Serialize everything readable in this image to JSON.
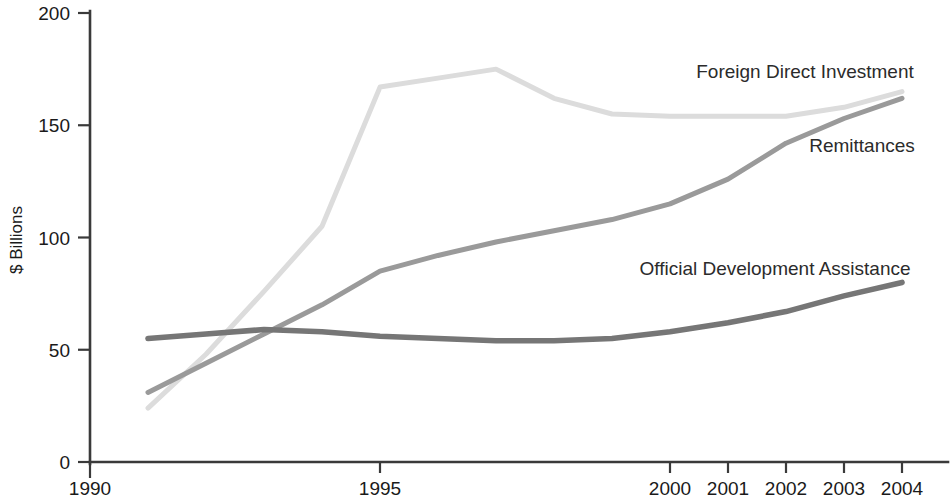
{
  "chart_data": {
    "type": "line",
    "title": "",
    "subtitle": "",
    "xlabel": "",
    "ylabel": "$ Billions",
    "ylim": [
      0,
      200
    ],
    "xlim": [
      1990,
      2004.3
    ],
    "grid": false,
    "legend_position": "inline-right-of-series",
    "y_ticks": [
      0,
      50,
      100,
      150,
      200
    ],
    "y_tick_labels": [
      "0",
      "50",
      "100",
      "150",
      "200"
    ],
    "x_ticks": [
      1990,
      1995,
      2000,
      2001,
      2002,
      2003,
      2004
    ],
    "x_tick_labels": [
      "1990",
      "1995",
      "2000",
      "2001",
      "2002",
      "2003",
      "2004"
    ],
    "x": [
      1991,
      1992,
      1993,
      1994,
      1995,
      1996,
      1997,
      1998,
      1999,
      2000,
      2001,
      2002,
      2003,
      2004
    ],
    "series": [
      {
        "name": "Foreign Direct Investment",
        "color": "#dcdcdc",
        "label_x": 2000.4,
        "label_y": 172,
        "values": [
          24,
          48,
          76,
          105,
          167,
          171,
          175,
          162,
          155,
          154,
          154,
          154,
          158,
          165
        ]
      },
      {
        "name": "Remittances",
        "color": "#9a9a9a",
        "label_x": 2002.3,
        "label_y": 143,
        "values": [
          31,
          44,
          57,
          70,
          85,
          92,
          98,
          103,
          108,
          115,
          126,
          142,
          153,
          162
        ]
      },
      {
        "name": "Official Development Assistance",
        "color": "#767676",
        "label_x": 1999.5,
        "label_y": 90,
        "values": [
          55,
          57,
          59,
          58,
          56,
          55,
          54,
          54,
          55,
          58,
          62,
          67,
          74,
          80
        ]
      }
    ]
  },
  "axes": {
    "y_axis_title": "$ Billions"
  }
}
